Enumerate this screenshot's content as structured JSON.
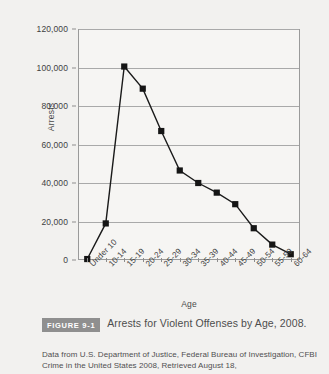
{
  "figure": {
    "badge_label": "FIGURE 9-1",
    "caption": "Arrests for Violent Offenses by Age, 2008.",
    "source": "Data from U.S. Department of Justice, Federal Bureau of Investigation, CFBI Crime in the United States 2008, Retrieved August 18,"
  },
  "colors": {
    "page_background": "#f2f1ef",
    "plot_background": "#f6f5f3",
    "axis": "#9a9a9a",
    "gridline": "#a9a9a9",
    "series_line": "#1a1a1a",
    "marker": "#151515",
    "badge_background": "#8f8f8f",
    "text": "#3f3f3f"
  },
  "chart_data": {
    "type": "line",
    "title": "Arrests for Violent Offenses by Age, 2008.",
    "xlabel": "Age",
    "ylabel": "Arrests",
    "categories": [
      "Under 10",
      "10-14",
      "15-19",
      "20-24",
      "25-29",
      "30-34",
      "35-39",
      "40-44",
      "45-49",
      "50-54",
      "55-59",
      "60-64"
    ],
    "values": [
      500,
      19000,
      100500,
      89000,
      67000,
      46500,
      40000,
      35000,
      29000,
      16500,
      8000,
      3000
    ],
    "ylim": [
      0,
      120000
    ],
    "yticks": [
      0,
      20000,
      40000,
      60000,
      80000,
      100000,
      120000
    ],
    "ytick_labels": [
      "0",
      "20,000",
      "40,000",
      "60,000",
      "80,000",
      "100,000",
      "120,000"
    ],
    "grid": true,
    "legend": "none",
    "marker": "square"
  }
}
